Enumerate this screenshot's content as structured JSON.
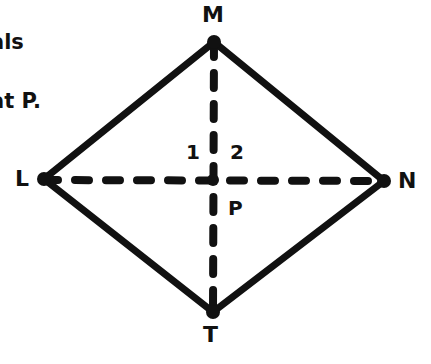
{
  "problem_text": {
    "line1": "als",
    "line2": "at P."
  },
  "diagram": {
    "shape": "rhombus",
    "vertices": {
      "M": {
        "label": "M",
        "x": 214,
        "y": 42
      },
      "L": {
        "label": "L",
        "x": 44,
        "y": 179
      },
      "N": {
        "label": "N",
        "x": 384,
        "y": 181
      },
      "T": {
        "label": "T",
        "x": 213,
        "y": 312
      }
    },
    "intersection": {
      "label": "P",
      "x": 213,
      "y": 180
    },
    "angle_labels": {
      "angle1": "1",
      "angle2": "2"
    },
    "diagonals": [
      "LN",
      "MT"
    ],
    "diagonal_style": "dashed",
    "stroke_color": "#111111"
  }
}
